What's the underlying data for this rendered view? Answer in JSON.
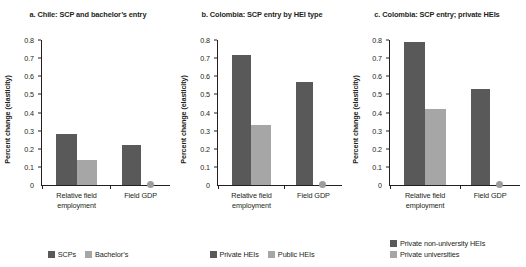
{
  "figure": {
    "ylabel": "Percent change (elasticity)",
    "colors": {
      "dark_series": "#595959",
      "light_series": "#a6a6a6",
      "zero_marker": "#9d9d9d",
      "axis": "#231f20",
      "background": "#ffffff"
    },
    "yticks": [
      "0.8",
      "0.7",
      "0.6",
      "0.5",
      "0.4",
      "0.3",
      "0.2",
      "0.1",
      "0"
    ],
    "xticks": [
      {
        "line1": "Relative field",
        "line2": "employment"
      },
      {
        "line1": "Field GDP",
        "line2": ""
      }
    ]
  },
  "chart_data": [
    {
      "type": "bar",
      "panel": "a",
      "title": "a. Chile: SCP and bachelor’s entry",
      "title_line1": "a. Chile: SCP and bachelor’s",
      "title_line2": "entry",
      "categories": [
        "Relative field employment",
        "Field GDP"
      ],
      "series": [
        {
          "name": "SCPs",
          "values": [
            0.28,
            0.22
          ],
          "color": "#595959"
        },
        {
          "name": "Bachelor’s",
          "values": [
            0.14,
            0.0
          ],
          "color": "#a6a6a6"
        }
      ],
      "xlabel": "",
      "ylabel": "Percent change (elasticity)",
      "ylim": [
        0,
        0.8
      ],
      "ytick_values": [
        0,
        0.1,
        0.2,
        0.3,
        0.4,
        0.5,
        0.6,
        0.7,
        0.8
      ],
      "grid": false,
      "legend_position": "bottom",
      "zero_marker_note": "Light series at Field GDP shown as a dot at 0"
    },
    {
      "type": "bar",
      "panel": "b",
      "title": "b. Colombia: SCP entry by HEI type",
      "title_line1": "b. Colombia: SCP entry by",
      "title_line2": "HEI type",
      "categories": [
        "Relative field employment",
        "Field GDP"
      ],
      "series": [
        {
          "name": "Private HEIs",
          "values": [
            0.72,
            0.57
          ],
          "color": "#595959"
        },
        {
          "name": "Public HEIs",
          "values": [
            0.33,
            0.0
          ],
          "color": "#a6a6a6"
        }
      ],
      "xlabel": "",
      "ylabel": "Percent change (elasticity)",
      "ylim": [
        0,
        0.8
      ],
      "ytick_values": [
        0,
        0.1,
        0.2,
        0.3,
        0.4,
        0.5,
        0.6,
        0.7,
        0.8
      ],
      "grid": false,
      "legend_position": "bottom",
      "zero_marker_note": "Light series at Field GDP shown as a dot at 0"
    },
    {
      "type": "bar",
      "panel": "c",
      "title": "c. Colombia: SCP entry; private HEIs",
      "title_line1": "c. Colombia: SCP entry;",
      "title_line2": "private HEIs",
      "categories": [
        "Relative field employment",
        "Field GDP"
      ],
      "series": [
        {
          "name": "Private non-university HEIs",
          "values": [
            0.79,
            0.53
          ],
          "color": "#595959"
        },
        {
          "name": "Private universities",
          "values": [
            0.42,
            0.0
          ],
          "color": "#a6a6a6"
        }
      ],
      "xlabel": "",
      "ylabel": "Percent change (elasticity)",
      "ylim": [
        0,
        0.8
      ],
      "ytick_values": [
        0,
        0.1,
        0.2,
        0.3,
        0.4,
        0.5,
        0.6,
        0.7,
        0.8
      ],
      "grid": false,
      "legend_position": "bottom",
      "zero_marker_note": "Light series at Field GDP shown as a dot at 0"
    }
  ]
}
